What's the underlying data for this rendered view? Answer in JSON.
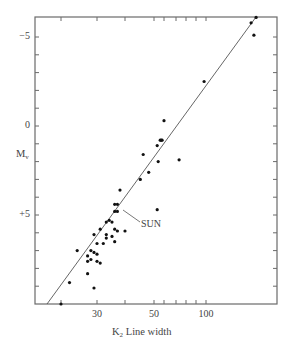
{
  "chart_data": {
    "type": "scatter",
    "title": "",
    "xlabel": "K2 Line width",
    "xlabel_main": "K",
    "xlabel_sub": "2",
    "xlabel_rest": " Line width",
    "ylabel": "Mv",
    "ylabel_main": "M",
    "ylabel_sub": "v",
    "x_scale": "log",
    "y_inverted": true,
    "ylim": [
      -6,
      10
    ],
    "xlim": [
      15,
      200
    ],
    "grid": false,
    "x_ticks": [
      20,
      30,
      40,
      50,
      60,
      70,
      80,
      90,
      100
    ],
    "x_tick_labels": [
      {
        "value": 30,
        "label": "30"
      },
      {
        "value": 50,
        "label": "50"
      },
      {
        "value": 100,
        "label": "100"
      }
    ],
    "y_ticks": [
      -5,
      -4,
      -3,
      -2,
      -1,
      0,
      1,
      2,
      3,
      4,
      5,
      6,
      7,
      8,
      9
    ],
    "y_tick_labels": [
      {
        "value": -5,
        "label": "−5"
      },
      {
        "value": 0,
        "label": "0"
      },
      {
        "value": 5,
        "label": "+5"
      }
    ],
    "annotation": {
      "text": "SUN",
      "x": 36,
      "y": 4.4
    },
    "fit_line": {
      "x": [
        17,
        172
      ],
      "y": [
        10,
        -6.1
      ]
    },
    "points": [
      {
        "x": 172,
        "y": -6.1
      },
      {
        "x": 163,
        "y": -5.8
      },
      {
        "x": 168,
        "y": -5.1
      },
      {
        "x": 98,
        "y": -2.5
      },
      {
        "x": 60,
        "y": -0.3
      },
      {
        "x": 57,
        "y": 0.8
      },
      {
        "x": 58,
        "y": 0.8
      },
      {
        "x": 56,
        "y": 0.8
      },
      {
        "x": 53,
        "y": 1.1
      },
      {
        "x": 54,
        "y": 2.0
      },
      {
        "x": 73,
        "y": 1.9
      },
      {
        "x": 48,
        "y": 2.6
      },
      {
        "x": 46,
        "y": 1.6
      },
      {
        "x": 38,
        "y": 3.6
      },
      {
        "x": 45,
        "y": 3.0
      },
      {
        "x": 36,
        "y": 4.4
      },
      {
        "x": 37,
        "y": 4.4
      },
      {
        "x": 36,
        "y": 4.8
      },
      {
        "x": 37,
        "y": 4.8
      },
      {
        "x": 53,
        "y": 4.7
      },
      {
        "x": 33,
        "y": 5.4
      },
      {
        "x": 35,
        "y": 5.4
      },
      {
        "x": 36,
        "y": 5.8
      },
      {
        "x": 37,
        "y": 5.9
      },
      {
        "x": 40,
        "y": 5.9
      },
      {
        "x": 34,
        "y": 5.3
      },
      {
        "x": 31,
        "y": 5.8
      },
      {
        "x": 33,
        "y": 6.1
      },
      {
        "x": 33,
        "y": 6.3
      },
      {
        "x": 30,
        "y": 6.6
      },
      {
        "x": 32,
        "y": 6.6
      },
      {
        "x": 35,
        "y": 6.2
      },
      {
        "x": 36,
        "y": 6.5
      },
      {
        "x": 29,
        "y": 6.1
      },
      {
        "x": 28,
        "y": 7.0
      },
      {
        "x": 29,
        "y": 7.1
      },
      {
        "x": 27,
        "y": 7.3
      },
      {
        "x": 27,
        "y": 7.6
      },
      {
        "x": 28,
        "y": 7.5
      },
      {
        "x": 30,
        "y": 7.6
      },
      {
        "x": 30,
        "y": 7.2
      },
      {
        "x": 24,
        "y": 7.0
      },
      {
        "x": 27,
        "y": 8.3
      },
      {
        "x": 29,
        "y": 9.1
      },
      {
        "x": 22,
        "y": 8.8
      },
      {
        "x": 20,
        "y": 10.0
      },
      {
        "x": 31,
        "y": 7.7
      }
    ],
    "plot_frame_px": {
      "left": 35,
      "right": 277,
      "top": 17,
      "bottom": 304
    }
  },
  "colors": {
    "axis": "#6a6a6a",
    "point": "#111111",
    "line": "#555555",
    "text": "#444444"
  }
}
